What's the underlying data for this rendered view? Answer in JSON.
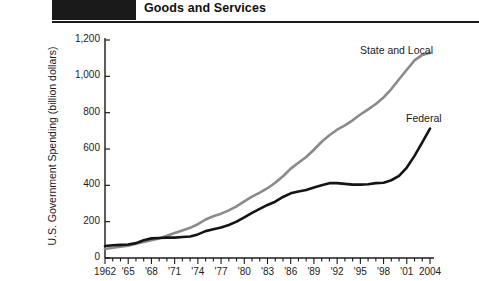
{
  "header": {
    "title": "Goods and Services",
    "swatch_color": "#1a1a1a",
    "rule_color": "#1a1a1a"
  },
  "chart_data": {
    "type": "line",
    "title": "Goods and Services",
    "xlabel": "",
    "ylabel": "U.S. Government Spending (billion dollars)",
    "xlim": [
      1962,
      2004
    ],
    "ylim": [
      0,
      1200
    ],
    "grid": false,
    "legend_position": "inline-right",
    "ytick_labels": [
      "1,200",
      "1,000",
      "800",
      "600",
      "400",
      "200",
      "0"
    ],
    "ytick_values": [
      1200,
      1000,
      800,
      600,
      400,
      200,
      0
    ],
    "xtick_labels": [
      "1962",
      "'65",
      "'68",
      "'71",
      "'74",
      "'77",
      "'80",
      "'83",
      "'86",
      "'89",
      "'92",
      "'95",
      "'98",
      "'01",
      "2004"
    ],
    "xtick_values": [
      1962,
      1965,
      1968,
      1971,
      1974,
      1977,
      1980,
      1983,
      1986,
      1989,
      1992,
      1995,
      1998,
      2001,
      2004
    ],
    "minor_xticks": true,
    "x": [
      1962,
      1963,
      1964,
      1965,
      1966,
      1967,
      1968,
      1969,
      1970,
      1971,
      1972,
      1973,
      1974,
      1975,
      1976,
      1977,
      1978,
      1979,
      1980,
      1981,
      1982,
      1983,
      1984,
      1985,
      1986,
      1987,
      1988,
      1989,
      1990,
      1991,
      1992,
      1993,
      1994,
      1995,
      1996,
      1997,
      1998,
      1999,
      2000,
      2001,
      2002,
      2003,
      2004
    ],
    "series": [
      {
        "name": "State and Local",
        "color": "#8a8a8a",
        "label_x": 2000,
        "label_y": 1250,
        "values": [
          50,
          56,
          62,
          68,
          78,
          88,
          98,
          108,
          122,
          138,
          152,
          166,
          186,
          212,
          230,
          244,
          262,
          284,
          312,
          338,
          360,
          384,
          414,
          450,
          492,
          524,
          556,
          596,
          640,
          676,
          706,
          730,
          758,
          790,
          818,
          848,
          884,
          930,
          984,
          1036,
          1088,
          1118,
          1130
        ]
      },
      {
        "name": "Federal",
        "color": "#141414",
        "label_x": 2000,
        "label_y": 800,
        "values": [
          66,
          70,
          72,
          74,
          82,
          98,
          108,
          110,
          112,
          112,
          116,
          118,
          130,
          148,
          158,
          168,
          182,
          200,
          224,
          248,
          270,
          292,
          310,
          336,
          356,
          366,
          374,
          388,
          400,
          412,
          412,
          408,
          404,
          404,
          406,
          412,
          414,
          428,
          452,
          498,
          562,
          636,
          712
        ]
      }
    ]
  },
  "axes": {
    "y_axis_name": "y-axis",
    "x_axis_name": "x-axis"
  }
}
